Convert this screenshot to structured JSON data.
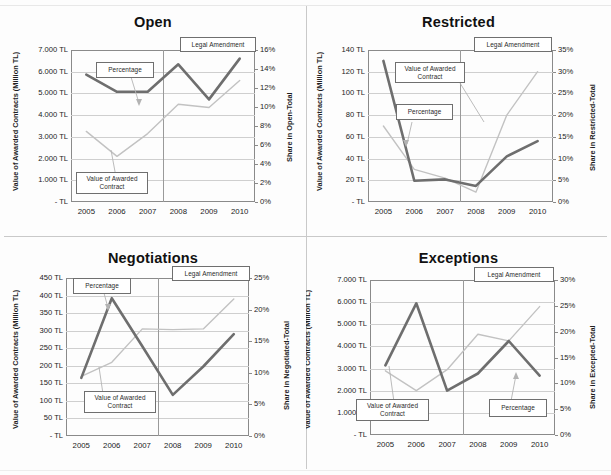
{
  "figure": {
    "layout": "2x2 grid of dual-axis line charts",
    "divider_color": "#c9c9c9"
  },
  "common": {
    "x_categories": [
      "2005",
      "2006",
      "2007",
      "2008",
      "2009",
      "2010"
    ],
    "ylabel_left": "Value of Awarded Contracts (Million TL)",
    "callout_percentage": "Percentage",
    "callout_value": "Value of Awarded Contract",
    "callout_amendment": "Legal Amendment",
    "series_names": [
      "Value of Awarded Contract",
      "Percentage"
    ],
    "color_percentage": "#6e6e6e",
    "color_value": "#c2c2c2"
  },
  "charts": [
    {
      "id": "open",
      "title": "Open",
      "ylabel_right": "Share in Open-Total",
      "y_left_ticks": [
        "7.000 TL",
        "6.000 TL",
        "5.000 TL",
        "4.000 TL",
        "3.000 TL",
        "2.000 TL",
        "1.000 TL",
        "- TL"
      ],
      "y_right_ticks": [
        "16%",
        "14%",
        "12%",
        "10%",
        "8%",
        "6%",
        "4%",
        "2%",
        "0%"
      ],
      "chart_data": {
        "type": "line",
        "title": "Open",
        "xlabel": "",
        "ylabel": "Value of Awarded Contracts (Million TL)",
        "ylabel_secondary": "Share in Open-Total",
        "x": [
          "2005",
          "2006",
          "2007",
          "2008",
          "2009",
          "2010"
        ],
        "ylim": [
          0,
          7000
        ],
        "ylim_secondary": [
          0,
          16
        ],
        "grid": true,
        "legend": "callout-labels",
        "series": [
          {
            "name": "Value of Awarded Contract",
            "axis": "left",
            "values": [
              3250,
              2100,
              3150,
              4500,
              4350,
              5600
            ]
          },
          {
            "name": "Percentage",
            "axis": "right",
            "values": [
              13.4,
              11.6,
              11.6,
              14.5,
              10.8,
              15.1
            ]
          }
        ],
        "annotations": [
          {
            "label": "Legal Amendment",
            "x": "2008",
            "type": "vertical-line"
          }
        ]
      }
    },
    {
      "id": "restricted",
      "title": "Restricted",
      "ylabel_right": "Share in Restricted-Total",
      "y_left_ticks": [
        "140 TL",
        "120 TL",
        "100 TL",
        "80 TL",
        "60 TL",
        "40 TL",
        "20 TL",
        "- TL"
      ],
      "y_right_ticks": [
        "35%",
        "30%",
        "25%",
        "20%",
        "15%",
        "10%",
        "5%",
        "0%"
      ],
      "chart_data": {
        "type": "line",
        "title": "Restricted",
        "xlabel": "",
        "ylabel": "Value of Awarded Contracts (Million TL)",
        "ylabel_secondary": "Share in Restricted-Total",
        "x": [
          "2005",
          "2006",
          "2007",
          "2008",
          "2009",
          "2010"
        ],
        "ylim": [
          0,
          140
        ],
        "ylim_secondary": [
          0,
          35
        ],
        "grid": true,
        "legend": "callout-labels",
        "series": [
          {
            "name": "Value of Awarded Contract",
            "axis": "left",
            "values": [
              70,
              30,
              22,
              9,
              80,
              120
            ]
          },
          {
            "name": "Percentage",
            "axis": "right",
            "values": [
              32.5,
              4.9,
              5.2,
              3.7,
              10.5,
              14.0
            ]
          }
        ],
        "annotations": [
          {
            "label": "Legal Amendment",
            "x": "2008",
            "type": "vertical-line"
          }
        ]
      }
    },
    {
      "id": "negotiations",
      "title": "Negotiations",
      "ylabel_right": "Share in Negotiated-Total",
      "y_left_ticks": [
        "450 TL",
        "400 TL",
        "350 TL",
        "300 TL",
        "250 TL",
        "200 TL",
        "150 TL",
        "100 TL",
        "50 TL",
        "- TL"
      ],
      "y_right_ticks": [
        "25%",
        "20%",
        "15%",
        "10%",
        "5%",
        "0%"
      ],
      "chart_data": {
        "type": "line",
        "title": "Negotiations",
        "xlabel": "",
        "ylabel": "Value of Awarded Contracts (Million TL)",
        "ylabel_secondary": "Share in Negotiated-Total",
        "x": [
          "2005",
          "2006",
          "2007",
          "2008",
          "2009",
          "2010"
        ],
        "ylim": [
          0,
          450
        ],
        "ylim_secondary": [
          0,
          25
        ],
        "grid": true,
        "legend": "callout-labels",
        "series": [
          {
            "name": "Value of Awarded Contract",
            "axis": "left",
            "values": [
              170,
              210,
              305,
              303,
              305,
              390
            ]
          },
          {
            "name": "Percentage",
            "axis": "right",
            "values": [
              9.2,
              21.8,
              14.2,
              6.5,
              11.0,
              16.1
            ]
          }
        ],
        "annotations": [
          {
            "label": "Legal Amendment",
            "x": "2008",
            "type": "vertical-line"
          }
        ]
      }
    },
    {
      "id": "exceptions",
      "title": "Exceptions",
      "ylabel_right": "Share in Excepted-Total",
      "y_left_ticks": [
        "7.000 TL",
        "6.000 TL",
        "5.000 TL",
        "4.000 TL",
        "3.000 TL",
        "2.000 TL",
        "1.000 TL",
        "- TL"
      ],
      "y_right_ticks": [
        "30%",
        "25%",
        "20%",
        "15%",
        "10%",
        "5%",
        "0%"
      ],
      "chart_data": {
        "type": "line",
        "title": "Exceptions",
        "xlabel": "",
        "ylabel": "Value of Awarded Contracts (Million TL)",
        "ylabel_secondary": "Share in Excepted-Total",
        "x": [
          "2005",
          "2006",
          "2007",
          "2008",
          "2009",
          "2010"
        ],
        "ylim": [
          0,
          7000
        ],
        "ylim_secondary": [
          0,
          30
        ],
        "grid": true,
        "legend": "callout-labels",
        "series": [
          {
            "name": "Value of Awarded Contract",
            "axis": "left",
            "values": [
              2900,
              2000,
              2950,
              4550,
              4250,
              5800
            ]
          },
          {
            "name": "Percentage",
            "axis": "right",
            "values": [
              13.5,
              25.5,
              8.6,
              11.9,
              18.2,
              11.5
            ]
          }
        ],
        "annotations": [
          {
            "label": "Legal Amendment",
            "x": "2008",
            "type": "vertical-line"
          }
        ]
      }
    }
  ]
}
